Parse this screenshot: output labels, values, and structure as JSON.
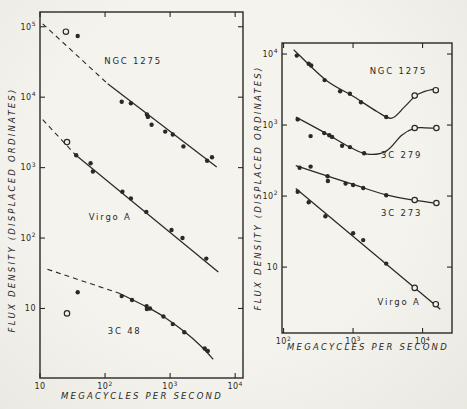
{
  "figure": {
    "y_axis_label": "FLUX DENSITY (DISPLACED ORDINATES)",
    "x_axis_label": "MEGACYCLES PER SECOND"
  },
  "chart_data": [
    {
      "panel": "left",
      "type": "scatter",
      "title": "",
      "xlabel": "MEGACYCLES PER SECOND",
      "ylabel": "FLUX DENSITY (DISPLACED ORDINATES)",
      "xscale": "log",
      "yscale": "log",
      "xlim": [
        10,
        13200
      ],
      "ylim": [
        1.03,
        162000
      ],
      "xticks": [
        10,
        100,
        1000,
        10000
      ],
      "yticks": [
        10,
        100,
        1000,
        10000,
        100000
      ],
      "grid": false,
      "px_rect": [
        40,
        12,
        243,
        378
      ],
      "series": [
        {
          "name": "NGC 1275",
          "label_xy": [
            270,
            30000
          ],
          "open_points": [
            [
              25,
              85000
            ]
          ],
          "points": [
            [
              38,
              74000
            ],
            [
              180,
              8600
            ],
            [
              250,
              8200
            ],
            [
              440,
              5700
            ],
            [
              455,
              5250
            ],
            [
              520,
              4050
            ],
            [
              840,
              3250
            ],
            [
              1100,
              2950
            ],
            [
              1600,
              2000
            ],
            [
              3700,
              1250
            ],
            [
              4400,
              1400
            ]
          ],
          "dash": [
            [
              11,
              110000
            ],
            [
              110,
              15500
            ]
          ],
          "line": [
            [
              110,
              15500
            ],
            [
              5200,
              1020
            ]
          ],
          "smooth": false
        },
        {
          "name": "Virgo A",
          "label_xy": [
            120,
            180
          ],
          "open_points": [
            [
              26,
              2300
            ]
          ],
          "points": [
            [
              36,
              1500
            ],
            [
              60,
              1150
            ],
            [
              65,
              880
            ],
            [
              185,
              455
            ],
            [
              250,
              365
            ],
            [
              430,
              235
            ],
            [
              1050,
              130
            ],
            [
              1550,
              100
            ],
            [
              3600,
              51
            ]
          ],
          "dash": [
            [
              11,
              4800
            ],
            [
              36,
              1480
            ]
          ],
          "line": [
            [
              35,
              1520
            ],
            [
              5500,
              33
            ]
          ],
          "smooth": false
        },
        {
          "name": "3C 48",
          "label_xy": [
            200,
            4.4
          ],
          "open_points": [
            [
              26,
              8.5
            ]
          ],
          "points": [
            [
              38,
              17
            ],
            [
              180,
              15
            ],
            [
              260,
              13.2
            ],
            [
              435,
              10.8
            ],
            [
              440,
              9.8
            ],
            [
              490,
              10
            ],
            [
              790,
              7.7
            ],
            [
              1100,
              6
            ],
            [
              1650,
              4.6
            ],
            [
              3400,
              2.7
            ],
            [
              3800,
              2.5
            ]
          ],
          "dash": [
            [
              13,
              36
            ],
            [
              165,
              16.5
            ]
          ],
          "line": [
            [
              165,
              16.5
            ],
            [
              440,
              10.5
            ],
            [
              790,
              7.7
            ],
            [
              1650,
              4.7
            ],
            [
              3000,
              2.9
            ],
            [
              4600,
              1.9
            ]
          ],
          "smooth": true
        }
      ]
    },
    {
      "panel": "right",
      "type": "scatter",
      "title": "",
      "xlabel": "MEGACYCLES PER SECOND",
      "ylabel": "FLUX DENSITY (DISPLACED ORDINATES)",
      "xscale": "log",
      "yscale": "log",
      "xlim": [
        95,
        26500
      ],
      "ylim": [
        1.18,
        14300
      ],
      "xticks": [
        100,
        1000,
        10000
      ],
      "yticks": [
        10,
        100,
        1000,
        10000
      ],
      "grid": false,
      "px_rect": [
        282,
        43,
        452,
        333
      ],
      "series": [
        {
          "name": "NGC 1275",
          "label_xy": [
            4500,
            5200
          ],
          "open_points": [
            [
              7700,
              2600
            ],
            [
              15500,
              3100
            ]
          ],
          "points": [
            [
              155,
              9500
            ],
            [
              230,
              7300
            ],
            [
              250,
              6900
            ],
            [
              390,
              4300
            ],
            [
              650,
              3000
            ],
            [
              900,
              2750
            ],
            [
              1300,
              2100
            ],
            [
              3000,
              1300
            ]
          ],
          "dash": [],
          "line": [
            [
              140,
              11500
            ],
            [
              400,
              4350
            ],
            [
              1000,
              2550
            ],
            [
              2200,
              1550
            ],
            [
              3600,
              1250
            ],
            [
              5500,
              1800
            ],
            [
              8000,
              2600
            ],
            [
              11000,
              3000
            ],
            [
              16000,
              3250
            ]
          ],
          "smooth": true
        },
        {
          "name": "3C 279",
          "label_xy": [
            5000,
            345
          ],
          "open_points": [
            [
              7700,
              910
            ],
            [
              15800,
              910
            ]
          ],
          "points": [
            [
              160,
              1200
            ],
            [
              245,
              700
            ],
            [
              385,
              770
            ],
            [
              455,
              720
            ],
            [
              500,
              680
            ],
            [
              695,
              510
            ],
            [
              900,
              490
            ],
            [
              1440,
              400
            ]
          ],
          "dash": [],
          "line": [
            [
              150,
              1300
            ],
            [
              400,
              770
            ],
            [
              900,
              490
            ],
            [
              1600,
              390
            ],
            [
              3000,
              430
            ],
            [
              5000,
              720
            ],
            [
              7700,
              905
            ],
            [
              11000,
              915
            ],
            [
              16000,
              905
            ]
          ],
          "smooth": true
        },
        {
          "name": "3C 273",
          "label_xy": [
            5000,
            52
          ],
          "open_points": [
            [
              7700,
              88
            ],
            [
              15800,
              80
            ]
          ],
          "points": [
            [
              170,
              250
            ],
            [
              245,
              260
            ],
            [
              430,
              190
            ],
            [
              435,
              163
            ],
            [
              780,
              150
            ],
            [
              1000,
              143
            ],
            [
              1400,
              130
            ],
            [
              3000,
              103
            ]
          ],
          "dash": [],
          "line": [
            [
              150,
              268
            ],
            [
              400,
              196
            ],
            [
              1000,
              146
            ],
            [
              3000,
              104
            ],
            [
              8000,
              87
            ],
            [
              16000,
              79
            ]
          ],
          "smooth": true
        },
        {
          "name": "Virgo A",
          "label_xy": [
            4600,
            2.9
          ],
          "open_points": [
            [
              7700,
              5.1
            ],
            [
              15500,
              3.0
            ]
          ],
          "points": [
            [
              160,
              115
            ],
            [
              230,
              82
            ],
            [
              400,
              52
            ],
            [
              1000,
              30
            ],
            [
              1400,
              24
            ],
            [
              3000,
              11.2
            ]
          ],
          "dash": [],
          "line": [
            [
              150,
              128
            ],
            [
              18000,
              2.55
            ]
          ],
          "smooth": false
        }
      ]
    }
  ],
  "style": {
    "ink_color": "#2a2925",
    "paper_color": "#f2f1ec"
  }
}
